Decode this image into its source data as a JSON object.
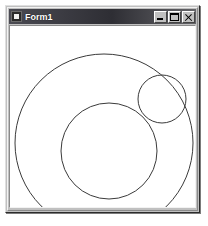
{
  "window": {
    "title": "Form1",
    "icon": "vb-form-icon",
    "frame_color": "#c0c0c0",
    "titlebar_color": "#2e2e34",
    "client_color": "#ffffff"
  },
  "caption_buttons": [
    {
      "name": "minimize",
      "label": "_",
      "tooltip": "Minimize"
    },
    {
      "name": "maximize",
      "label": "□",
      "tooltip": "Maximize"
    },
    {
      "name": "close",
      "label": "✕",
      "tooltip": "Close"
    }
  ],
  "canvas": {
    "description": "Three overlapping circle outlines drawn on the form surface",
    "stroke_color": "#3a3a3a",
    "stroke_width": 1,
    "background": "#ffffff",
    "shapes": [
      {
        "name": "large-circle",
        "cx": 102,
        "cy": 131,
        "r": 89
      },
      {
        "name": "medium-circle",
        "cx": 107,
        "cy": 139,
        "r": 48
      },
      {
        "name": "small-circle",
        "cx": 160,
        "cy": 87,
        "r": 24
      }
    ]
  }
}
